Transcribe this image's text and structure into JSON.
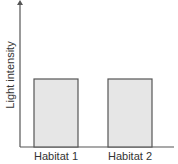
{
  "chart_data": {
    "type": "bar",
    "title": "",
    "xlabel": "",
    "ylabel": "Light intensity",
    "categories": [
      "Habitat 1",
      "Habitat 2"
    ],
    "values": [
      1,
      1
    ],
    "ylim": [
      0,
      2
    ],
    "grid": false,
    "legend": null,
    "y_ticks_shown": false,
    "annotation": "Bars are equal height (relative, unlabeled axis)"
  },
  "colors": {
    "axis": "#555555",
    "bar_fill": "#e6e6e6",
    "bar_stroke": "#555555",
    "text": "#333333"
  }
}
